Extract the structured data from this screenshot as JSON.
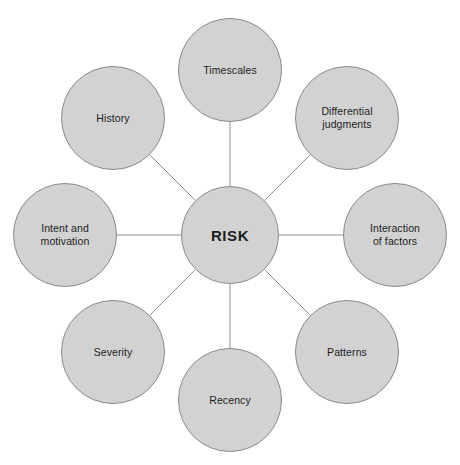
{
  "diagram": {
    "type": "radial-hub-and-spoke",
    "background_color": "#ffffff",
    "node_fill_color": "#d2d2d2",
    "node_border_color": "#8a8a8a",
    "edge_color": "#8f8f8f",
    "label_color": "#1d1d1d",
    "center": {
      "id": "risk",
      "label": "RISK",
      "cx": 230,
      "cy": 235,
      "r": 49
    },
    "satellites": [
      {
        "id": "timescales",
        "label": "Timescales",
        "cx": 230,
        "cy": 70,
        "r": 52,
        "angle_deg": 270
      },
      {
        "id": "differential",
        "label": "Differential\njudgments",
        "cx": 347,
        "cy": 118,
        "r": 52,
        "angle_deg": 315
      },
      {
        "id": "interaction",
        "label": "Interaction\nof factors",
        "cx": 395,
        "cy": 235,
        "r": 52,
        "angle_deg": 0
      },
      {
        "id": "patterns",
        "label": "Patterns",
        "cx": 347,
        "cy": 352,
        "r": 52,
        "angle_deg": 45
      },
      {
        "id": "recency",
        "label": "Recency",
        "cx": 230,
        "cy": 400,
        "r": 52,
        "angle_deg": 90
      },
      {
        "id": "severity",
        "label": "Severity",
        "cx": 113,
        "cy": 352,
        "r": 52,
        "angle_deg": 135
      },
      {
        "id": "intent",
        "label": "Intent and\nmotivation",
        "cx": 65,
        "cy": 235,
        "r": 52,
        "angle_deg": 180
      },
      {
        "id": "history",
        "label": "History",
        "cx": 113,
        "cy": 118,
        "r": 52,
        "angle_deg": 225
      }
    ]
  }
}
